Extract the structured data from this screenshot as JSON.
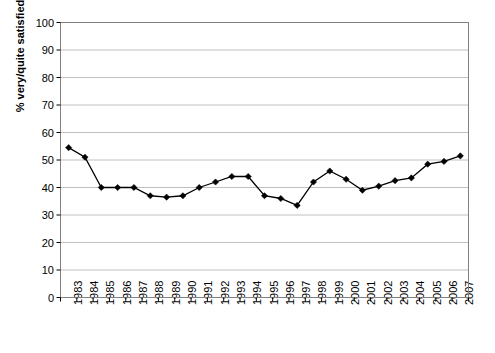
{
  "chart_data": {
    "type": "line",
    "title": "",
    "subtitle": "",
    "xlabel": "",
    "ylabel": "% very/quite satisfied",
    "ylim": [
      0,
      100
    ],
    "ytick_step": 10,
    "grid": true,
    "legend": false,
    "marker": "filled-diamond",
    "line_color": "#000000",
    "marker_color": "#000000",
    "grid_color": "#c0c0c0",
    "axis_color": "#808080",
    "categories": [
      "1983",
      "1984",
      "1985",
      "1986",
      "1987",
      "1988",
      "1989",
      "1990",
      "1991",
      "1992",
      "1993",
      "1994",
      "1995",
      "1996",
      "1997",
      "1998",
      "1999",
      "2000",
      "2001",
      "2002",
      "2003",
      "2004",
      "2005",
      "2006",
      "2007"
    ],
    "ytick_labels": [
      "0",
      "10",
      "20",
      "30",
      "40",
      "50",
      "60",
      "70",
      "80",
      "90",
      "100"
    ],
    "series": [
      {
        "name": "% very/quite satisfied",
        "values": [
          54.5,
          51.0,
          40.0,
          40.0,
          40.0,
          37.0,
          36.5,
          37.0,
          40.0,
          42.0,
          44.0,
          44.0,
          37.0,
          36.0,
          33.5,
          42.0,
          46.0,
          43.0,
          39.0,
          40.5,
          42.5,
          43.5,
          48.5,
          49.5,
          51.5
        ]
      }
    ]
  }
}
